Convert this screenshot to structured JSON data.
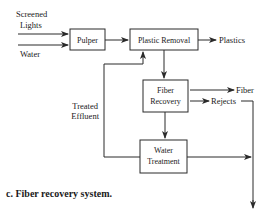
{
  "diagram": {
    "inputs": {
      "screened_lights_line1": "Screened",
      "screened_lights_line2": "Lights",
      "water": "Water"
    },
    "nodes": {
      "pulper": "Pulper",
      "plastic_removal": "Plastic Removal",
      "fiber_recovery_line1": "Fiber",
      "fiber_recovery_line2": "Recovery",
      "water_treatment_line1": "Water",
      "water_treatment_line2": "Treatment"
    },
    "outputs": {
      "plastics": "Plastics",
      "fiber": "Fiber",
      "rejects": "Rejects"
    },
    "feedback": {
      "line1": "Treated",
      "line2": "Effluent"
    },
    "colors": {
      "stroke": "#2a2a2a",
      "text": "#1a1a1a",
      "background": "#ffffff"
    }
  },
  "caption": "c.  Fiber recovery system."
}
